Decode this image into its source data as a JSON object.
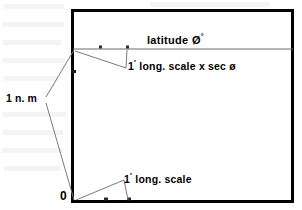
{
  "figure": {
    "frame": {
      "x": 71,
      "y": 9,
      "width": 222,
      "height": 193,
      "border_color": "#000000",
      "border_width": 3,
      "fill": "#ffffff"
    },
    "latitude_line": {
      "y": 49,
      "x_start": 73,
      "x_end": 293,
      "color": "#6b6b6b",
      "width": 1
    },
    "labels": {
      "latitude": {
        "text": "latitude",
        "symbol": "Ø",
        "superscript": "°",
        "x": 147,
        "y": 33
      },
      "sec_scale": {
        "prefix": "1",
        "prime": "′",
        "text": "long. scale  x  sec",
        "symbol": "ø",
        "x": 128,
        "y": 59
      },
      "nautical_mile": {
        "text": "1 n. m",
        "x": 6,
        "y": 93
      },
      "long_scale": {
        "prefix": "1",
        "prime": "′",
        "text": "long. scale",
        "x": 124,
        "y": 172
      },
      "origin": {
        "text": "0",
        "x": 60,
        "y": 190
      }
    },
    "tick_marks": [
      {
        "name": "latitude-tick-left",
        "x": 100,
        "y": 47
      },
      {
        "name": "latitude-tick-right",
        "x": 127,
        "y": 47
      },
      {
        "name": "baseline-tick-left",
        "x": 105,
        "y": 200
      },
      {
        "name": "baseline-tick-right",
        "x": 128,
        "y": 200
      },
      {
        "name": "left-edge-tick",
        "x": 73,
        "y": 72
      }
    ],
    "leader_lines": {
      "color": "#7a7a7a",
      "width": 1,
      "nautical_mile_upper": {
        "x1": 46,
        "y1": 97,
        "x2": 74,
        "y2": 50
      },
      "nautical_mile_lower": {
        "x1": 46,
        "y1": 103,
        "x2": 74,
        "y2": 200
      },
      "sec_scale_from_edge": {
        "x1": 75,
        "y1": 51,
        "x2": 126,
        "y2": 68
      },
      "sec_scale_from_tick": {
        "x1": 127,
        "y1": 49,
        "x2": 126,
        "y2": 68
      },
      "long_scale_from_origin": {
        "x1": 76,
        "y1": 200,
        "x2": 124,
        "y2": 180
      },
      "long_scale_from_tick": {
        "x1": 128,
        "y1": 200,
        "x2": 124,
        "y2": 180
      }
    }
  }
}
